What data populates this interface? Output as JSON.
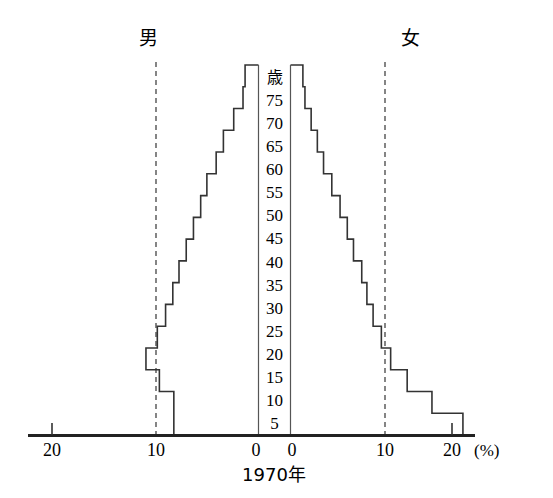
{
  "chart_data": {
    "type": "bar",
    "subtype": "population-pyramid",
    "title": "",
    "xlabel": "1970年",
    "ylabel": "歳",
    "unit_label": "(%)",
    "left_series_label": "男",
    "right_series_label": "女",
    "age_axis_labels": [
      "歳",
      "75",
      "70",
      "65",
      "60",
      "55",
      "50",
      "45",
      "40",
      "35",
      "30",
      "25",
      "20",
      "15",
      "10",
      "5"
    ],
    "categories": [
      "0-4",
      "5-9",
      "10-14",
      "15-19",
      "20-24",
      "25-29",
      "30-34",
      "35-39",
      "40-44",
      "45-49",
      "50-54",
      "55-59",
      "60-64",
      "65-69",
      "70-74",
      "75-79",
      "80+"
    ],
    "x_tick_labels_left": [
      "20",
      "10",
      "0"
    ],
    "x_tick_labels_right": [
      "0",
      "10",
      "20"
    ],
    "xlim": [
      0,
      20
    ],
    "grid": false,
    "guide_lines_at": [
      10
    ],
    "legend_position": "top",
    "series": [
      {
        "name": "男",
        "side": "left",
        "values": [
          8.2,
          8.2,
          9.6,
          10.9,
          9.8,
          9.0,
          8.3,
          7.7,
          7.0,
          6.3,
          5.6,
          5.0,
          4.1,
          3.4,
          2.4,
          1.5,
          1.3
        ]
      },
      {
        "name": "女",
        "side": "right",
        "values": [
          16.7,
          13.7,
          11.3,
          9.7,
          8.8,
          8.0,
          7.4,
          6.9,
          6.1,
          5.5,
          4.8,
          4.0,
          3.2,
          2.6,
          2.0,
          1.4,
          1.2
        ]
      }
    ]
  },
  "axis": {
    "center_top_label": "歳",
    "year_label": "1970年",
    "percent_label": "(%)"
  }
}
